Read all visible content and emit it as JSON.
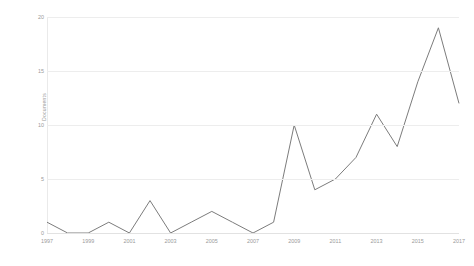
{
  "chart_data": {
    "type": "line",
    "title": "",
    "subtitle": "",
    "xlabel": "",
    "ylabel": "Documents",
    "x": [
      1997,
      1998,
      1999,
      2000,
      2001,
      2002,
      2003,
      2004,
      2005,
      2006,
      2007,
      2008,
      2009,
      2010,
      2011,
      2012,
      2013,
      2014,
      2015,
      2016,
      2017
    ],
    "values": [
      1,
      0,
      0,
      1,
      0,
      3,
      0,
      1,
      2,
      1,
      0,
      1,
      10,
      4,
      5,
      7,
      11,
      8,
      14,
      19,
      12
    ],
    "series": [
      {
        "name": "Documents",
        "values": [
          1,
          0,
          0,
          1,
          0,
          3,
          0,
          1,
          2,
          1,
          0,
          1,
          10,
          4,
          5,
          7,
          11,
          8,
          14,
          19,
          12
        ]
      }
    ],
    "xlim": [
      1997,
      2017
    ],
    "ylim": [
      0,
      20
    ],
    "y_ticks": [
      0,
      5,
      10,
      15,
      20
    ],
    "y_tick_labels": [
      "0",
      "5",
      "10",
      "15",
      "20"
    ],
    "x_ticks": [
      1997,
      1999,
      2001,
      2003,
      2005,
      2007,
      2009,
      2011,
      2013,
      2015,
      2017
    ],
    "x_tick_labels": [
      "1997",
      "1999",
      "2001",
      "2003",
      "2005",
      "2007",
      "2009",
      "2011",
      "2013",
      "2015",
      "2017"
    ],
    "grid": "horizontal",
    "legend": "none",
    "line_color": "#7c7c7c",
    "grid_color": "#ededed",
    "background_color": "#ffffff",
    "text_color": "#9a9a9a"
  }
}
